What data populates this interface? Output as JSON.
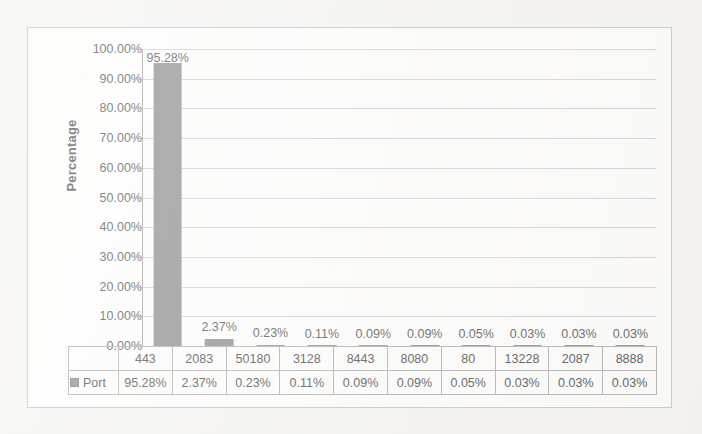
{
  "chart_data": {
    "type": "bar",
    "title": "",
    "xlabel": "",
    "ylabel": "Percentage",
    "categories": [
      "443",
      "2083",
      "50180",
      "3128",
      "8443",
      "8080",
      "80",
      "13228",
      "2087",
      "8888"
    ],
    "values": [
      95.28,
      2.37,
      0.23,
      0.11,
      0.09,
      0.09,
      0.05,
      0.03,
      0.03,
      0.03
    ],
    "value_labels": [
      "95.28%",
      "2.37%",
      "0.23%",
      "0.11%",
      "0.09%",
      "0.09%",
      "0.05%",
      "0.03%",
      "0.03%",
      "0.03%"
    ],
    "series": [
      {
        "name": "Port",
        "color": "#767676",
        "values": [
          95.28,
          2.37,
          0.23,
          0.11,
          0.09,
          0.09,
          0.05,
          0.03,
          0.03,
          0.03
        ]
      }
    ],
    "ylim": [
      0,
      100
    ],
    "y_ticks": [
      0,
      10,
      20,
      30,
      40,
      50,
      60,
      70,
      80,
      90,
      100
    ],
    "y_tick_labels": [
      "0.00%",
      "10.00%",
      "20.00%",
      "30.00%",
      "40.00%",
      "50.00%",
      "60.00%",
      "70.00%",
      "80.00%",
      "90.00%",
      "100.00%"
    ],
    "grid": true,
    "legend_position": "data-table-left",
    "data_table_visible": true
  },
  "legend": {
    "series_label": "Port",
    "swatch_color": "#767676"
  },
  "colors": {
    "bar": "#767676",
    "gridline": "#c8c8c8",
    "axis": "#8e8e8e",
    "frame_border": "#b9b9b9",
    "table_border": "#9d9d9d",
    "plot_background": "#fdfdfc",
    "page_background": "#f4f3f1"
  }
}
